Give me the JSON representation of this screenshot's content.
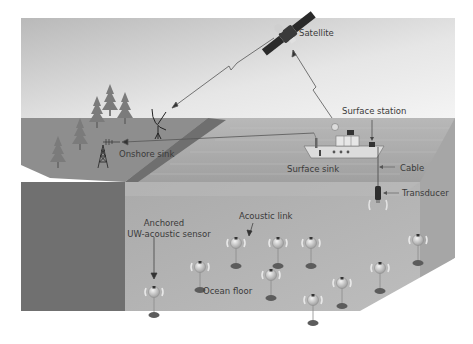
{
  "diagram": {
    "colors": {
      "sky_top": "#bdbdbd",
      "sky_bottom": "#f2f2f2",
      "land_top": "#8f8f8f",
      "land_cliff": "#6e6e6e",
      "ocean_surface": "#a9a9a9",
      "water_front": "#b4b4b4",
      "water_side": "#9c9c9c",
      "sensor_anchor": "#5a5a5a",
      "label_text": "#3a3a3a"
    },
    "labels": {
      "satellite": "Satellite",
      "onshore_sink": "Onshore sink",
      "surface_station": "Surface station",
      "surface_sink": "Surface sink",
      "cable": "Cable",
      "transducer": "Transducer",
      "acoustic_link": "Acoustic link",
      "anchored_sensor_line1": "Anchored",
      "anchored_sensor_line2": "UW-acoustic sensor",
      "ocean_floor": "Ocean floor"
    },
    "nodes": [
      {
        "id": "satellite",
        "label": "Satellite"
      },
      {
        "id": "onshore-sink",
        "label": "Onshore sink"
      },
      {
        "id": "surface-station",
        "label": "Surface station"
      },
      {
        "id": "surface-sink",
        "label": "Surface sink"
      },
      {
        "id": "transducer",
        "label": "Transducer"
      },
      {
        "id": "uw-sensors",
        "label": "Anchored UW-acoustic sensor",
        "count": 10
      }
    ],
    "links": [
      {
        "from": "surface-sink",
        "to": "satellite",
        "type": "radio"
      },
      {
        "from": "satellite",
        "to": "onshore-sink",
        "type": "radio"
      },
      {
        "from": "surface-sink",
        "to": "onshore-sink",
        "type": "radio"
      },
      {
        "from": "surface-station",
        "to": "transducer",
        "type": "cable"
      },
      {
        "from": "uw-sensors",
        "to": "transducer",
        "type": "acoustic"
      }
    ]
  }
}
